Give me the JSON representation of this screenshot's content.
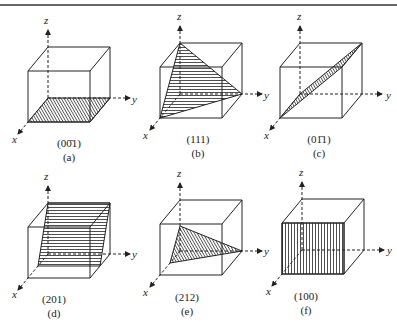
{
  "panels": [
    {
      "id": "a",
      "plane": "(00̄1)",
      "caption": "(a)"
    },
    {
      "id": "b",
      "plane": "(111)",
      "caption": "(b)"
    },
    {
      "id": "c",
      "plane": "(01̄1)",
      "caption": "(c)"
    },
    {
      "id": "d",
      "plane": "(201)",
      "caption": "(d)"
    },
    {
      "id": "e",
      "plane": "(212)",
      "caption": "(e)"
    },
    {
      "id": "f",
      "plane": "(100)",
      "caption": "(f)"
    }
  ],
  "axes": {
    "x": "x",
    "y": "y",
    "z": "z"
  },
  "colors": {
    "line": "#222222",
    "background": "#ffffff"
  }
}
